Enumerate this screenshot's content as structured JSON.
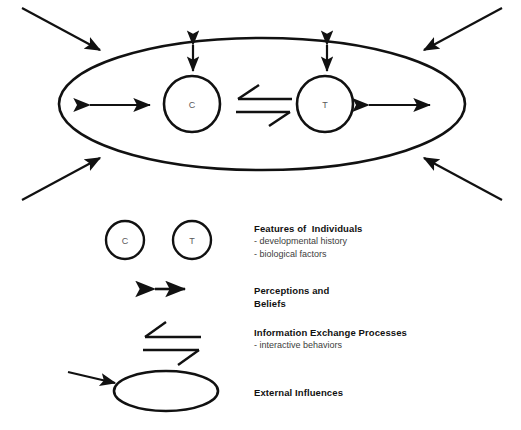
{
  "diagram": {
    "stroke_color": "#111111",
    "label_color": "#5a5a5a",
    "background": "#ffffff",
    "main_system": {
      "name": "external-influences-boundary",
      "shape": "ellipse"
    },
    "nodes": [
      {
        "id": "c",
        "label": "C",
        "shape": "circle"
      },
      {
        "id": "t",
        "label": "T",
        "shape": "circle"
      }
    ],
    "connectors": [
      {
        "id": "c-perception",
        "type": "double-arrow-vertical",
        "from": "c",
        "to": "boundary"
      },
      {
        "id": "t-perception",
        "type": "double-arrow-vertical",
        "from": "t",
        "to": "boundary"
      },
      {
        "id": "c-left-exchange",
        "type": "double-arrow-horizontal"
      },
      {
        "id": "t-right-exchange",
        "type": "double-arrow-horizontal"
      },
      {
        "id": "c-t-exchange",
        "type": "equilibrium-harpoons",
        "from": "c",
        "to": "t"
      }
    ],
    "external_arrows": [
      {
        "id": "external-arrow-top-left",
        "direction": "down-right"
      },
      {
        "id": "external-arrow-top-right",
        "direction": "down-left"
      },
      {
        "id": "external-arrow-bottom-left",
        "direction": "up-right"
      },
      {
        "id": "external-arrow-bottom-right",
        "direction": "up-left"
      }
    ]
  },
  "legend": {
    "items": [
      {
        "id": "features-of-individuals",
        "symbol": "two-circles",
        "circle_labels": [
          "C",
          "T"
        ],
        "title": "Features of  Individuals",
        "lines": [
          "- developmental history",
          "- biological factors"
        ]
      },
      {
        "id": "perceptions-and-beliefs",
        "symbol": "double-arrow",
        "title": "Perceptions and\nBeliefs",
        "lines": []
      },
      {
        "id": "information-exchange-processes",
        "symbol": "equilibrium-harpoons",
        "title": "Information Exchange Processes",
        "lines": [
          "- interactive behaviors"
        ]
      },
      {
        "id": "external-influences",
        "symbol": "ellipse-with-arrow",
        "title": "External Influences",
        "lines": []
      }
    ]
  }
}
